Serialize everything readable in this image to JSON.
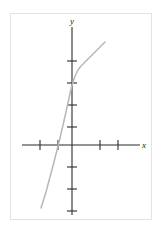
{
  "figure": {
    "kind": "cartesian-coordinate-plane",
    "frame_color": "#e3e3e3",
    "background_color": "#ffffff"
  },
  "axes": {
    "x_label": "x",
    "y_label": "y",
    "axis_color": "#2b2b2b",
    "origin": {
      "x": 72,
      "y": 145
    },
    "unit_px": 18,
    "x_axis": {
      "start_px": 22,
      "end_px": 140,
      "tick_positions_px": [
        40,
        58,
        100,
        118
      ],
      "tick_values": [
        -2,
        -1,
        1,
        2
      ],
      "tick_half_length_px": 5
    },
    "y_axis": {
      "start_px": 27,
      "end_px": 215,
      "tick_positions_px": [
        61,
        83,
        105,
        127,
        167,
        189,
        211
      ],
      "tick_values": [
        3,
        2,
        1,
        0.5,
        -1,
        -2,
        -3
      ],
      "tick_half_length_px": 5
    }
  },
  "curve": {
    "color": "#b8b8b8",
    "stroke_width": 1.5,
    "description": "increasing cubic-like curve",
    "path": "M 41 208 L 46 192 L 50 177 L 54 162 L 57 150 L 60 138 L 63 125 L 66 112 L 69 98 L 72 85 L 75 76 L 78 70 L 81 66 L 84 63 L 87 60 L 90 57 L 93 54 L 96 51 L 99 48 L 102 45 L 105 42",
    "x_intercept_px": 55,
    "y_intercept_px": 85
  },
  "chart_data": {
    "type": "line",
    "title": "",
    "xlabel": "x",
    "ylabel": "y",
    "grid": false,
    "legend": null,
    "xlim": [
      -2.8,
      3.8
    ],
    "ylim": [
      -3.5,
      5.7
    ],
    "xticks": [
      -2,
      -1,
      1,
      2
    ],
    "yticks": [
      3,
      2,
      1,
      0.5,
      -1,
      -2,
      -3
    ],
    "series": [
      {
        "name": "curve",
        "color": "#b8b8b8",
        "x": [
          -1.72,
          -1.44,
          -1.22,
          -1.0,
          -0.83,
          -0.67,
          -0.5,
          -0.33,
          -0.17,
          0.0,
          0.17,
          0.33,
          0.5,
          0.67,
          0.83,
          1.0,
          1.17,
          1.33,
          1.5,
          1.67,
          1.83
        ],
        "y": [
          -3.5,
          -2.61,
          -1.78,
          -0.94,
          -0.28,
          0.39,
          1.11,
          1.83,
          2.61,
          3.33,
          3.83,
          4.17,
          4.39,
          4.56,
          4.72,
          4.89,
          5.06,
          5.22,
          5.39,
          5.56,
          5.72
        ]
      }
    ]
  }
}
